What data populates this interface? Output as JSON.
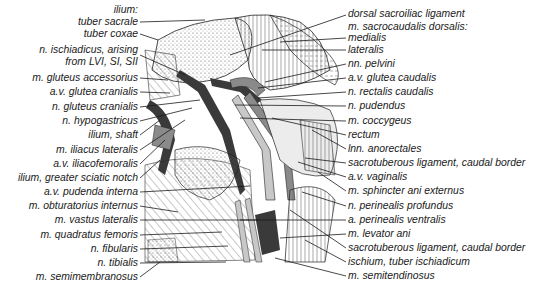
{
  "figure": {
    "left_labels": [
      {
        "text": "ilium:",
        "y": 4
      },
      {
        "text": "tuber sacrale",
        "y": 16
      },
      {
        "text": "tuber coxae",
        "y": 28
      },
      {
        "text": "n. ischiadicus, arising",
        "y": 44
      },
      {
        "text": "from LVI, SI, SII",
        "y": 56
      },
      {
        "text": "m. gluteus accessorius",
        "y": 72
      },
      {
        "text": "a.v. glutea cranialis",
        "y": 86
      },
      {
        "text": "n. gluteus cranialis",
        "y": 101
      },
      {
        "text": "n. hypogastricus",
        "y": 115
      },
      {
        "text": "ilium, shaft",
        "y": 129
      },
      {
        "text": "m. iliacus lateralis",
        "y": 144
      },
      {
        "text": "a.v. iliacofemoralis",
        "y": 158
      },
      {
        "text": "ilium, greater sciatic notch",
        "y": 172
      },
      {
        "text": "a.v. pudenda interna",
        "y": 186
      },
      {
        "text": "m. obturatorius internus",
        "y": 200
      },
      {
        "text": "m. vastus lateralis",
        "y": 214
      },
      {
        "text": "m. quadratus femoris",
        "y": 229
      },
      {
        "text": "n. fibularis",
        "y": 243
      },
      {
        "text": "n. tibialis",
        "y": 257
      },
      {
        "text": "m. semimembranosus",
        "y": 271
      }
    ],
    "right_labels": [
      {
        "text": "dorsal sacroiliac ligament",
        "y": 8
      },
      {
        "text": "m. sacrocaudalis dorsalis:",
        "y": 21
      },
      {
        "text": "medialis",
        "y": 32
      },
      {
        "text": "lateralis",
        "y": 44
      },
      {
        "text": "nn. pelvini",
        "y": 58
      },
      {
        "text": "a.v. glutea caudalis",
        "y": 72
      },
      {
        "text": "n. rectalis caudalis",
        "y": 86
      },
      {
        "text": "n. pudendus",
        "y": 100
      },
      {
        "text": "m. coccygeus",
        "y": 115
      },
      {
        "text": "rectum",
        "y": 129
      },
      {
        "text": "lnn. anorectales",
        "y": 143
      },
      {
        "text": "sacrotuberous ligament, caudal border",
        "y": 157
      },
      {
        "text": "a.v. vaginalis",
        "y": 171
      },
      {
        "text": "m. sphincter ani externus",
        "y": 185
      },
      {
        "text": "n. perinealis profundus",
        "y": 200
      },
      {
        "text": "a. perinealis ventralis",
        "y": 214
      },
      {
        "text": "m. levator ani",
        "y": 228
      },
      {
        "text": "sacrotuberous ligament, caudal border",
        "y": 242
      },
      {
        "text": "ischium, tuber ischiadicum",
        "y": 256
      },
      {
        "text": "m. semitendinosus",
        "y": 270
      }
    ],
    "colors": {
      "ink": "#1a1a1a",
      "dark_vessel": "#3a3a3a",
      "mid_gray": "#8a8a8a",
      "light_gray": "#c8c8c8",
      "background": "#ffffff"
    }
  }
}
